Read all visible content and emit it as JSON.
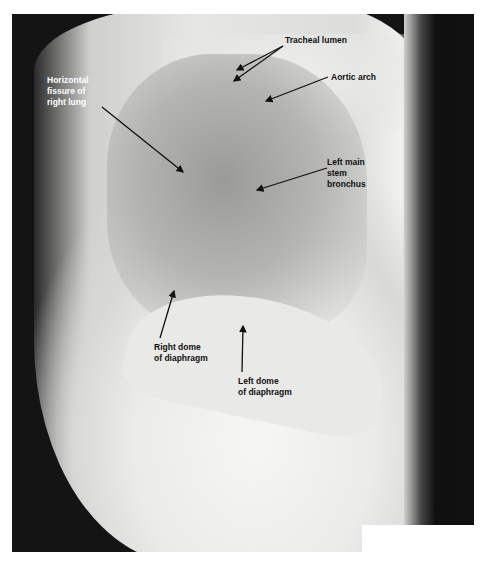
{
  "figure": {
    "type": "lateral chest radiograph",
    "labels": {
      "tracheal_lumen": "Tracheal lumen",
      "aortic_arch": "Aortic arch",
      "horizontal_fissure": "Horizontal\nfissure of\nright lung",
      "left_main_stem_bronchus": "Left main\nstem\nbronchus",
      "right_dome": "Right dome\nof diaphragm",
      "left_dome": "Left dome\nof diaphragm"
    },
    "colors": {
      "label_dark": "#111111",
      "label_light": "#ffffff",
      "background_film": "#141414"
    }
  }
}
